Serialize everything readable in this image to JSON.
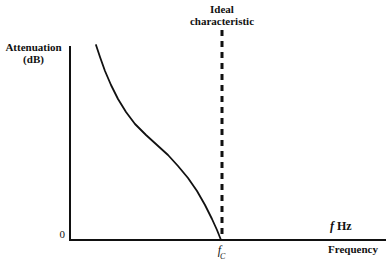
{
  "figure": {
    "background_color": "#ffffff",
    "ink_color": "#111111"
  },
  "annotation": {
    "line1": "Ideal",
    "line2": "characteristic"
  },
  "y_axis": {
    "label_line1": "Attenuation",
    "label_line2": "(dB)",
    "origin_label": "0"
  },
  "x_axis": {
    "unit_label_italic": "f",
    "unit_label_rest": " Hz",
    "name_label": "Frequency",
    "tick_label_italic": "f",
    "tick_label_sub": "C"
  },
  "chart_data": {
    "type": "line",
    "title": "Ideal characteristic",
    "xlabel": "Frequency",
    "ylabel": "Attenuation (dB)",
    "xlabel_unit": "f Hz",
    "grid": false,
    "legend": "none",
    "axis_tick_labels": {
      "x": [
        "f_C"
      ],
      "y": [
        "0"
      ]
    },
    "axis_pixel_geometry": {
      "y_axis_x": 70,
      "y_axis_top_y": 47,
      "x_axis_y": 240,
      "x_axis_left_x": 70,
      "x_axis_right_x": 385
    },
    "annotations": [
      {
        "text": "Ideal characteristic",
        "type": "vertical-dashed-line",
        "x_pixel": 222,
        "y_top_pixel": 30,
        "y_bottom_pixel": 240,
        "dash_length": 6,
        "gap_length": 5,
        "line_width": 3,
        "color": "#111111"
      }
    ],
    "series": [
      {
        "name": "Practical attenuation response",
        "description": "Attenuation falls from a high value at low frequency, flattens through an inflection, then drops steeply to 0 dB at the cut-off frequency f_C",
        "color": "#111111",
        "line_width": 1.8,
        "points_pixel": [
          [
            96,
            45
          ],
          [
            100,
            57
          ],
          [
            105,
            71
          ],
          [
            111,
            85
          ],
          [
            118,
            99
          ],
          [
            126,
            112
          ],
          [
            135,
            124
          ],
          [
            146,
            135
          ],
          [
            157,
            145
          ],
          [
            168,
            155
          ],
          [
            178,
            166
          ],
          [
            188,
            178
          ],
          [
            197,
            191
          ],
          [
            205,
            205
          ],
          [
            212,
            219
          ],
          [
            217,
            230
          ],
          [
            221,
            240
          ]
        ],
        "x_start_pixel": 96,
        "x_end_pixel": 221,
        "y_start_pixel": 45,
        "y_end_pixel": 240
      }
    ]
  }
}
